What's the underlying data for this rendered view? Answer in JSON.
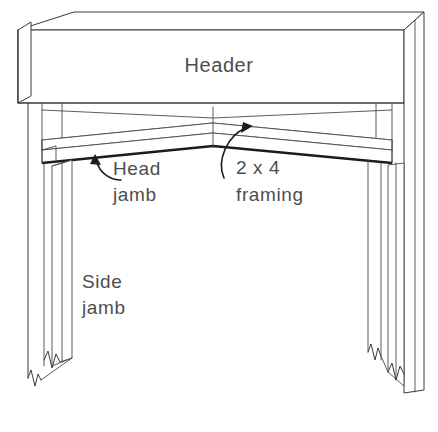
{
  "diagram": {
    "background_color": "#ffffff",
    "line_color": "#3a3a3a",
    "bold_line_color": "#1c1c1c",
    "text_color": "#4d4d4d",
    "labels": {
      "header": "Header",
      "head_jamb_line1": "Head",
      "head_jamb_line2": "jamb",
      "framing_line1": "2  x  4",
      "framing_line2": "framing",
      "side_jamb_line1": "Side",
      "side_jamb_line2": "jamb"
    },
    "parts": [
      {
        "name": "header",
        "label": "Header",
        "description": "Horizontal beam across top of opening shown in perspective"
      },
      {
        "name": "head-jamb",
        "label": "Head jamb",
        "description": "V-shaped board under the header seen in perspective"
      },
      {
        "name": "framing",
        "label": "2 x 4 framing",
        "description": "Structural 2 by 4 lumber behind the jamb"
      },
      {
        "name": "side-jamb",
        "label": "Side jamb",
        "description": "Vertical jamb boards on left and right of opening"
      }
    ]
  }
}
